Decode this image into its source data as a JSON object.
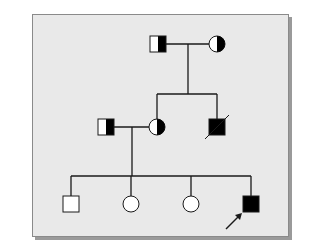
{
  "colors": {
    "background": "#e9e9e9",
    "frame_border": "#8a8a8a",
    "shadow": "#9a9a9a",
    "line": "#1a1a1a",
    "affected": "#000000",
    "unaffected": "#ffffff"
  },
  "symbol_size": 16,
  "generations": [
    {
      "label": "I",
      "individuals": [
        {
          "id": "I-1",
          "sex": "male",
          "status": "carrier",
          "x": 158,
          "y": 44
        },
        {
          "id": "I-2",
          "sex": "female",
          "status": "carrier",
          "x": 217,
          "y": 44
        }
      ]
    },
    {
      "label": "II",
      "individuals": [
        {
          "id": "II-1",
          "sex": "male",
          "status": "carrier",
          "x": 106,
          "y": 127,
          "spouse_of": "II-2"
        },
        {
          "id": "II-2",
          "sex": "female",
          "status": "carrier",
          "x": 157,
          "y": 127
        },
        {
          "id": "II-3",
          "sex": "male",
          "status": "affected",
          "deceased": true,
          "x": 217,
          "y": 127
        }
      ]
    },
    {
      "label": "III",
      "individuals": [
        {
          "id": "III-1",
          "sex": "male",
          "status": "unaffected",
          "x": 71,
          "y": 204
        },
        {
          "id": "III-2",
          "sex": "female",
          "status": "unaffected",
          "x": 131,
          "y": 204
        },
        {
          "id": "III-3",
          "sex": "female",
          "status": "unaffected",
          "x": 191,
          "y": 204
        },
        {
          "id": "III-4",
          "sex": "male",
          "status": "affected",
          "proband": true,
          "x": 251,
          "y": 204
        }
      ]
    }
  ],
  "legend_hidden": {
    "carrier": "half-filled symbol",
    "affected": "filled symbol",
    "unaffected": "open symbol",
    "deceased": "diagonal slash",
    "proband": "arrow"
  }
}
